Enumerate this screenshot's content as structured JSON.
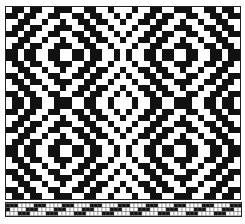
{
  "figure": {
    "colors": {
      "ink": "#111111",
      "ground": "#ffffff",
      "frame": "#222222"
    },
    "pattern": {
      "cols": 54,
      "rows": 46,
      "motif": "mirrored-diamond-quadrants"
    },
    "draft_strip": {
      "cols": 58,
      "rows": 3
    }
  }
}
